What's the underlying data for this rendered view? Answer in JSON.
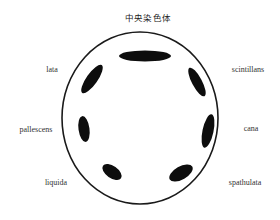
{
  "title": "中央染色体",
  "colors": {
    "background": "#ffffff",
    "outline": "#1a1a1a",
    "chromosome": "#0d0d0d",
    "label": "#333333"
  },
  "circle": {
    "cx": 140,
    "cy": 118,
    "rx": 78,
    "ry": 86
  },
  "chromosomes": [
    {
      "name": "top-central",
      "cx": 145,
      "cy": 56,
      "rx": 26,
      "ry": 5.5,
      "angle": 0
    },
    {
      "name": "upper-left",
      "cx": 92,
      "cy": 79,
      "rx": 17,
      "ry": 5.5,
      "angle": -55
    },
    {
      "name": "upper-right",
      "cx": 197,
      "cy": 82,
      "rx": 16,
      "ry": 5,
      "angle": 62
    },
    {
      "name": "mid-left",
      "cx": 84,
      "cy": 129,
      "rx": 13,
      "ry": 5.5,
      "angle": 82
    },
    {
      "name": "mid-right",
      "cx": 208,
      "cy": 131,
      "rx": 17,
      "ry": 5.5,
      "angle": -78
    },
    {
      "name": "lower-left",
      "cx": 112,
      "cy": 172,
      "rx": 11,
      "ry": 6,
      "angle": 35
    },
    {
      "name": "lower-right",
      "cx": 181,
      "cy": 173,
      "rx": 13,
      "ry": 6.5,
      "angle": -30
    }
  ],
  "labels": [
    {
      "text": "lata",
      "x": 52,
      "y": 70
    },
    {
      "text": "scintillans",
      "x": 248,
      "y": 70
    },
    {
      "text": "pallescens",
      "x": 36,
      "y": 130
    },
    {
      "text": "cana",
      "x": 251,
      "y": 129
    },
    {
      "text": "liquida",
      "x": 56,
      "y": 183
    },
    {
      "text": "spathulata",
      "x": 245,
      "y": 183
    }
  ],
  "title_pos": {
    "x": 148,
    "y": 18
  }
}
